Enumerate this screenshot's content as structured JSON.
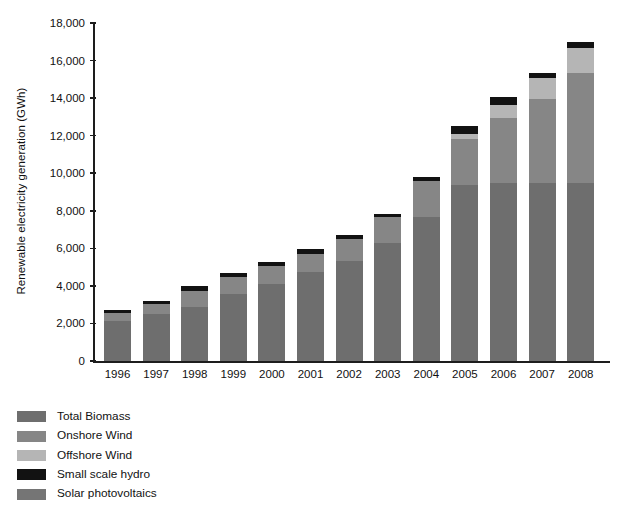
{
  "chart_data": {
    "type": "bar",
    "subtype": "stacked-vertical",
    "title": "",
    "xlabel": "",
    "ylabel": "Renewable electricity generation (GWh)",
    "categories": [
      "1996",
      "1997",
      "1998",
      "1999",
      "2000",
      "2001",
      "2002",
      "2003",
      "2004",
      "2005",
      "2006",
      "2007",
      "2008"
    ],
    "ylim": [
      0,
      18000
    ],
    "ytick_labels": [
      "0",
      "2,000",
      "4,000",
      "6,000",
      "8,000",
      "10,000",
      "12,000",
      "14,000",
      "16,000",
      "18,000"
    ],
    "ytick_values": [
      0,
      2000,
      4000,
      6000,
      8000,
      10000,
      12000,
      14000,
      16000,
      18000
    ],
    "grid": false,
    "legend_position": "below-left",
    "series": [
      {
        "name": "Total Biomass",
        "color": "#6e6e6e",
        "values": [
          2150,
          2500,
          2900,
          3550,
          4100,
          4750,
          5300,
          6300,
          7650,
          9400,
          9500,
          9500,
          9500
        ]
      },
      {
        "name": "Onshore Wind",
        "color": "#868686",
        "values": [
          400,
          550,
          850,
          900,
          950,
          950,
          1200,
          1350,
          1950,
          2450,
          3450,
          4450,
          5850
        ]
      },
      {
        "name": "Offshore Wind",
        "color": "#b5b5b5",
        "values": [
          0,
          0,
          0,
          0,
          0,
          0,
          0,
          0,
          0,
          250,
          700,
          1100,
          1300
        ]
      },
      {
        "name": "Small scale hydro",
        "color": "#121212",
        "values": [
          150,
          150,
          250,
          250,
          250,
          250,
          200,
          200,
          200,
          400,
          400,
          300,
          350
        ]
      },
      {
        "name": "Solar photovoltaics",
        "color": "#757575",
        "values": [
          0,
          0,
          0,
          0,
          0,
          0,
          0,
          0,
          0,
          0,
          0,
          0,
          0
        ]
      }
    ],
    "totals": [
      2700,
      3200,
      4000,
      4700,
      5300,
      5950,
      6700,
      7850,
      9800,
      12500,
      14050,
      15350,
      17000
    ]
  },
  "legend": {
    "items": [
      {
        "label": "Total Biomass",
        "color": "#6e6e6e"
      },
      {
        "label": "Onshore Wind",
        "color": "#868686"
      },
      {
        "label": "Offshore Wind",
        "color": "#b5b5b5"
      },
      {
        "label": "Small scale hydro",
        "color": "#121212"
      },
      {
        "label": "Solar photovoltaics",
        "color": "#757575"
      }
    ]
  },
  "axis": {
    "y_title": "Renewable electricity generation (GWh)"
  }
}
